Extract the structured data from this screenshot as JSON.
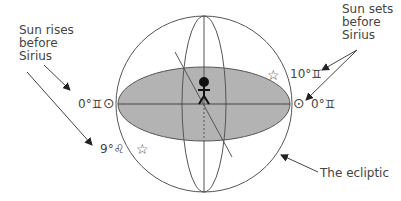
{
  "labels": {
    "sun_rises": "Sun rises\nbefore\nSirius",
    "sun_sets": "Sun sets\nbefore\nSirius",
    "ecliptic": "The ecliptic"
  },
  "markers": {
    "left_horizon_sun": "0°♊",
    "right_horizon_sun": "0°♊",
    "right_star": "10°♊",
    "left_star": "9°♌"
  },
  "icons": {
    "sun": "⊙",
    "star": "☆"
  },
  "colors": {
    "line": "#555555",
    "horizon_fill": "#b3b3b3",
    "text": "#444444"
  }
}
